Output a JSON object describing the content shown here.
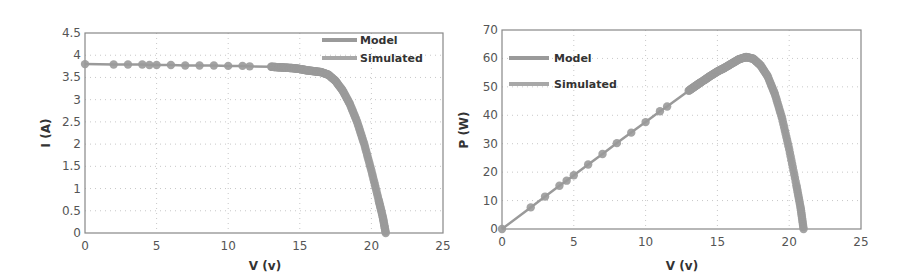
{
  "chart_data": [
    {
      "type": "line",
      "title": "",
      "xlabel": "V (v)",
      "ylabel": "I (A)",
      "xlim": [
        0,
        25
      ],
      "ylim": [
        0,
        4.5
      ],
      "xticks": [
        "0",
        "5",
        "10",
        "15",
        "20",
        "25"
      ],
      "yticks": [
        "0",
        "0.5",
        "1",
        "1.5",
        "2",
        "2.5",
        "3",
        "3.5",
        "4",
        "4.5"
      ],
      "grid": true,
      "legend_position": "upper right",
      "legend": [
        "Model",
        "Simulated"
      ],
      "x": [
        0,
        2,
        3,
        4,
        4.5,
        5,
        6,
        7,
        8,
        9,
        10,
        11,
        11.5,
        13,
        13.5,
        14,
        14.5,
        15,
        15.5,
        16,
        16.5,
        17,
        17.5,
        18,
        18.5,
        19,
        19.5,
        20,
        20.5,
        20.8,
        21
      ],
      "series": [
        {
          "name": "Model",
          "values": [
            3.8,
            3.79,
            3.79,
            3.79,
            3.78,
            3.78,
            3.78,
            3.77,
            3.77,
            3.77,
            3.76,
            3.76,
            3.75,
            3.74,
            3.73,
            3.72,
            3.71,
            3.69,
            3.66,
            3.64,
            3.62,
            3.56,
            3.42,
            3.2,
            2.9,
            2.5,
            2.0,
            1.4,
            0.75,
            0.35,
            0
          ]
        },
        {
          "name": "Simulated",
          "values": [
            3.8,
            3.79,
            3.79,
            3.79,
            3.78,
            3.78,
            3.78,
            3.77,
            3.77,
            3.77,
            3.76,
            3.76,
            3.75,
            3.74,
            3.73,
            3.72,
            3.71,
            3.69,
            3.66,
            3.64,
            3.62,
            3.56,
            3.42,
            3.2,
            2.9,
            2.5,
            2.0,
            1.4,
            0.75,
            0.35,
            0
          ]
        }
      ]
    },
    {
      "type": "line",
      "title": "",
      "xlabel": "V (v)",
      "ylabel": "P (W)",
      "xlim": [
        0,
        25
      ],
      "ylim": [
        0,
        70
      ],
      "xticks": [
        "0",
        "5",
        "10",
        "15",
        "20",
        "25"
      ],
      "yticks": [
        "0",
        "10",
        "20",
        "30",
        "40",
        "50",
        "60",
        "70"
      ],
      "grid": true,
      "legend_position": "upper left",
      "legend": [
        "Model",
        "Simulated"
      ],
      "x": [
        0,
        2,
        3,
        4,
        4.5,
        5,
        6,
        7,
        8,
        9,
        10,
        11,
        11.5,
        13,
        13.5,
        14,
        14.5,
        15,
        15.5,
        16,
        16.5,
        17,
        17.5,
        18,
        18.5,
        19,
        19.5,
        20,
        20.5,
        20.8,
        21
      ],
      "series": [
        {
          "name": "Model",
          "values": [
            0,
            7.6,
            11.4,
            15.2,
            17.0,
            18.9,
            22.7,
            26.4,
            30.2,
            33.9,
            37.6,
            41.4,
            43.1,
            48.6,
            50.4,
            52.1,
            53.8,
            55.4,
            56.7,
            58.2,
            59.7,
            60.5,
            59.9,
            57.6,
            53.7,
            47.5,
            39.0,
            28.0,
            15.4,
            7.3,
            0
          ]
        },
        {
          "name": "Simulated",
          "values": [
            0,
            7.6,
            11.4,
            15.2,
            17.0,
            18.9,
            22.7,
            26.4,
            30.2,
            33.9,
            37.6,
            41.4,
            43.1,
            48.6,
            50.4,
            52.1,
            53.8,
            55.4,
            56.7,
            58.2,
            59.7,
            60.5,
            59.9,
            57.6,
            53.7,
            47.5,
            39.0,
            28.0,
            15.4,
            7.3,
            0
          ]
        }
      ]
    }
  ],
  "colors": {
    "line": "#9a9a9a",
    "marker": "#9a9a9a",
    "axis": "#888888",
    "grid": "#c8c8c8",
    "text": "#555555"
  }
}
